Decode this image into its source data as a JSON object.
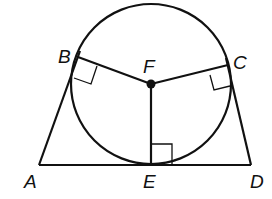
{
  "diagram": {
    "colors": {
      "stroke": "#111111",
      "background": "#ffffff"
    },
    "points": {
      "A": {
        "label": "A",
        "x": 39,
        "y": 165
      },
      "B": {
        "label": "B",
        "x": 78,
        "y": 57
      },
      "C": {
        "label": "C",
        "x": 228,
        "y": 65
      },
      "D": {
        "label": "D",
        "x": 251,
        "y": 165
      },
      "E": {
        "label": "E",
        "x": 151,
        "y": 165
      },
      "F": {
        "label": "F",
        "x": 151,
        "y": 84
      }
    },
    "circle": {
      "center": "F",
      "cx": 151,
      "cy": 84,
      "r": 80
    },
    "segments": [
      "AD",
      "AB",
      "CD",
      "FB",
      "FC",
      "FE"
    ],
    "right_angles": [
      "FBA",
      "FCD",
      "FED"
    ]
  }
}
